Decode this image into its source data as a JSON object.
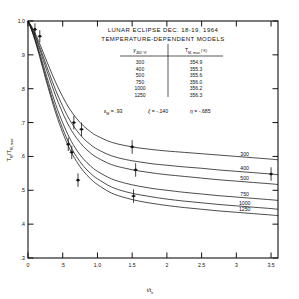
{
  "chart_data": {
    "type": "line",
    "title": "LUNAR ECLIPSE DEC. 18-19, 1964",
    "subtitle": "TEMPERATURE-DEPENDENT MODELS",
    "xlabel": "t/t",
    "xlabel_sub": "e",
    "ylabel": "T",
    "ylabel_sub1": "M",
    "ylabel_mid": "/T",
    "ylabel_sub2": "M, max",
    "xlim": [
      0,
      3.6
    ],
    "ylim": [
      0.3,
      1.0
    ],
    "grid": false,
    "legend_position": "right-inline",
    "xticks": [
      "0",
      ".5",
      "1.0",
      "1.5",
      "2",
      "2.5",
      "3",
      "3.5"
    ],
    "xtickvals": [
      0,
      0.5,
      1.0,
      1.5,
      2.0,
      2.5,
      3.0,
      3.5
    ],
    "yticks": [
      "1.0",
      ".9",
      ".8",
      ".7",
      ".6",
      ".5",
      ".4",
      ".3"
    ],
    "ytickvals": [
      1.0,
      0.9,
      0.8,
      0.7,
      0.6,
      0.5,
      0.4,
      0.3
    ],
    "series": [
      {
        "name": "300",
        "label": "300",
        "x": [
          0,
          0.05,
          0.1,
          0.15,
          0.2,
          0.3,
          0.4,
          0.5,
          0.6,
          0.7,
          0.8,
          0.9,
          1.0,
          1.2,
          1.4,
          1.6,
          1.8,
          2.0,
          2.25,
          2.5,
          2.75,
          3.0,
          3.25,
          3.5,
          3.6
        ],
        "y": [
          1.0,
          0.985,
          0.965,
          0.942,
          0.917,
          0.866,
          0.818,
          0.776,
          0.74,
          0.712,
          0.69,
          0.673,
          0.66,
          0.642,
          0.632,
          0.625,
          0.62,
          0.616,
          0.612,
          0.608,
          0.604,
          0.6,
          0.596,
          0.592,
          0.59
        ]
      },
      {
        "name": "400",
        "label": "400",
        "x": [
          0,
          0.05,
          0.1,
          0.15,
          0.2,
          0.3,
          0.4,
          0.5,
          0.6,
          0.7,
          0.8,
          0.9,
          1.0,
          1.2,
          1.4,
          1.6,
          1.8,
          2.0,
          2.25,
          2.5,
          2.75,
          3.0,
          3.25,
          3.5,
          3.6
        ],
        "y": [
          1.0,
          0.982,
          0.96,
          0.934,
          0.906,
          0.849,
          0.795,
          0.748,
          0.708,
          0.677,
          0.653,
          0.635,
          0.621,
          0.602,
          0.591,
          0.584,
          0.578,
          0.574,
          0.569,
          0.565,
          0.56,
          0.556,
          0.552,
          0.548,
          0.546
        ]
      },
      {
        "name": "500",
        "label": "500",
        "x": [
          0,
          0.05,
          0.1,
          0.15,
          0.2,
          0.3,
          0.4,
          0.5,
          0.6,
          0.7,
          0.8,
          0.9,
          1.0,
          1.2,
          1.4,
          1.6,
          1.8,
          2.0,
          2.25,
          2.5,
          2.75,
          3.0,
          3.25,
          3.5,
          3.6
        ],
        "y": [
          1.0,
          0.98,
          0.956,
          0.928,
          0.897,
          0.836,
          0.778,
          0.728,
          0.686,
          0.654,
          0.629,
          0.61,
          0.596,
          0.576,
          0.565,
          0.557,
          0.551,
          0.546,
          0.541,
          0.536,
          0.531,
          0.527,
          0.523,
          0.519,
          0.517
        ]
      },
      {
        "name": "750",
        "label": "750",
        "x": [
          0,
          0.05,
          0.1,
          0.15,
          0.2,
          0.3,
          0.4,
          0.5,
          0.6,
          0.7,
          0.8,
          0.9,
          1.0,
          1.2,
          1.4,
          1.6,
          1.8,
          2.0,
          2.25,
          2.5,
          2.75,
          3.0,
          3.25,
          3.5,
          3.6
        ],
        "y": [
          1.0,
          0.977,
          0.95,
          0.918,
          0.884,
          0.816,
          0.753,
          0.699,
          0.654,
          0.619,
          0.592,
          0.572,
          0.556,
          0.534,
          0.521,
          0.512,
          0.505,
          0.5,
          0.494,
          0.489,
          0.484,
          0.48,
          0.476,
          0.472,
          0.47
        ]
      },
      {
        "name": "1000",
        "label": "1000",
        "x": [
          0,
          0.05,
          0.1,
          0.15,
          0.2,
          0.3,
          0.4,
          0.5,
          0.6,
          0.7,
          0.8,
          0.9,
          1.0,
          1.2,
          1.4,
          1.6,
          1.8,
          2.0,
          2.25,
          2.5,
          2.75,
          3.0,
          3.25,
          3.5,
          3.6
        ],
        "y": [
          1.0,
          0.975,
          0.946,
          0.912,
          0.876,
          0.804,
          0.738,
          0.682,
          0.635,
          0.599,
          0.571,
          0.55,
          0.534,
          0.51,
          0.496,
          0.487,
          0.48,
          0.474,
          0.468,
          0.463,
          0.458,
          0.454,
          0.45,
          0.446,
          0.444
        ]
      },
      {
        "name": "1250",
        "label": "1250",
        "x": [
          0,
          0.05,
          0.1,
          0.15,
          0.2,
          0.3,
          0.4,
          0.5,
          0.6,
          0.7,
          0.8,
          0.9,
          1.0,
          1.2,
          1.4,
          1.6,
          1.8,
          2.0,
          2.25,
          2.5,
          2.75,
          3.0,
          3.25,
          3.5,
          3.6
        ],
        "y": [
          1.0,
          0.974,
          0.943,
          0.908,
          0.87,
          0.796,
          0.728,
          0.67,
          0.622,
          0.585,
          0.556,
          0.534,
          0.517,
          0.492,
          0.478,
          0.468,
          0.461,
          0.455,
          0.449,
          0.444,
          0.439,
          0.435,
          0.431,
          0.427,
          0.425
        ]
      }
    ],
    "observations": {
      "name": "measured points",
      "points": [
        {
          "x": 0.1,
          "y": 0.975,
          "yerr": 0.018
        },
        {
          "x": 0.17,
          "y": 0.955,
          "yerr": 0.018
        },
        {
          "x": 0.66,
          "y": 0.7,
          "yerr": 0.02
        },
        {
          "x": 0.77,
          "y": 0.68,
          "yerr": 0.02
        },
        {
          "x": 0.58,
          "y": 0.636,
          "yerr": 0.02
        },
        {
          "x": 0.63,
          "y": 0.612,
          "yerr": 0.02
        },
        {
          "x": 1.5,
          "y": 0.628,
          "yerr": 0.02
        },
        {
          "x": 1.55,
          "y": 0.56,
          "yerr": 0.02
        },
        {
          "x": 0.72,
          "y": 0.53,
          "yerr": 0.02
        },
        {
          "x": 1.52,
          "y": 0.483,
          "yerr": 0.02
        },
        {
          "x": 3.5,
          "y": 0.548,
          "yerr": 0.02
        }
      ]
    },
    "table": {
      "header_left_symbol": "γ",
      "header_left_sub": "350 °K",
      "header_right_symbol": "T",
      "header_right_sub": "M, max",
      "header_right_unit": "(°K)",
      "rows": [
        {
          "gamma": "300",
          "tmax": "354.9"
        },
        {
          "gamma": "400",
          "tmax": "355.3"
        },
        {
          "gamma": "500",
          "tmax": "355.6"
        },
        {
          "gamma": "750",
          "tmax": "356.0"
        },
        {
          "gamma": "1000",
          "tmax": "356.2"
        },
        {
          "gamma": "1250",
          "tmax": "356.3"
        }
      ]
    },
    "parameters": [
      {
        "symbol": "ε",
        "sub": "M",
        "value": "= .93"
      },
      {
        "symbol": "ξ",
        "sub": "",
        "value": "= -.140"
      },
      {
        "symbol": "η",
        "sub": "",
        "value": "= -.685"
      }
    ],
    "colors": {
      "line": "#111111",
      "axis": "#111111",
      "background": "#ffffff"
    }
  }
}
